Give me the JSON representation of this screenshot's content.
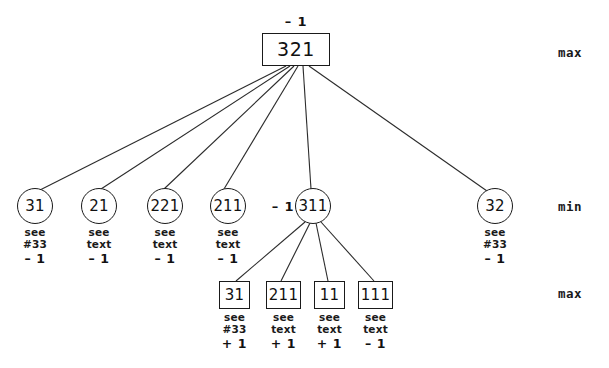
{
  "diagram": {
    "background_color": "#ffffff",
    "line_color": "#2b2b2b",
    "text_color": "#1a1a1a",
    "level_labels": [
      {
        "text": "max",
        "x": 558,
        "y": 52
      },
      {
        "text": "min",
        "x": 558,
        "y": 206
      },
      {
        "text": "max",
        "x": 558,
        "y": 293
      }
    ],
    "root": {
      "id": "root",
      "label": "321",
      "shape": "square",
      "x": 262,
      "y": 33,
      "width": 68,
      "height": 33,
      "value_tag": "– 1",
      "value_tag_x": 296,
      "value_tag_y": 21
    },
    "min_nodes": [
      {
        "id": "min-31",
        "label": "31",
        "shape": "circle",
        "cx": 35,
        "cy": 206,
        "r": 18,
        "annotation": {
          "line1": "see",
          "line2": "#33",
          "line3": "– 1"
        }
      },
      {
        "id": "min-21",
        "label": "21",
        "shape": "circle",
        "cx": 99,
        "cy": 206,
        "r": 18,
        "annotation": {
          "line1": "see",
          "line2": "text",
          "line3": "– 1"
        }
      },
      {
        "id": "min-221",
        "label": "221",
        "shape": "circle",
        "cx": 165,
        "cy": 206,
        "r": 18,
        "annotation": {
          "line1": "see",
          "line2": "text",
          "line3": "– 1"
        }
      },
      {
        "id": "min-211",
        "label": "211",
        "shape": "circle",
        "cx": 228,
        "cy": 206,
        "r": 18,
        "annotation": {
          "line1": "see",
          "line2": "text",
          "line3": "– 1"
        }
      },
      {
        "id": "min-311",
        "label": "311",
        "shape": "circle",
        "cx": 313,
        "cy": 206,
        "r": 18,
        "annotation": null,
        "value_tag": "– 1",
        "value_tag_x": 283,
        "value_tag_y": 206
      },
      {
        "id": "min-32",
        "label": "32",
        "shape": "circle",
        "cx": 495,
        "cy": 206,
        "r": 18,
        "annotation": {
          "line1": "see",
          "line2": "#33",
          "line3": "– 1"
        }
      }
    ],
    "leaf_nodes": [
      {
        "id": "leaf-31",
        "label": "31",
        "shape": "square",
        "x": 219,
        "y": 281,
        "width": 31,
        "height": 28,
        "annotation": {
          "line1": "see",
          "line2": "#33",
          "line3": "+ 1"
        }
      },
      {
        "id": "leaf-211",
        "label": "211",
        "shape": "square",
        "x": 266,
        "y": 281,
        "width": 35,
        "height": 28,
        "annotation": {
          "line1": "see",
          "line2": "text",
          "line3": "+ 1"
        }
      },
      {
        "id": "leaf-11",
        "label": "11",
        "shape": "square",
        "x": 314,
        "y": 281,
        "width": 31,
        "height": 28,
        "annotation": {
          "line1": "see",
          "line2": "text",
          "line3": "+ 1"
        }
      },
      {
        "id": "leaf-111",
        "label": "111",
        "shape": "square",
        "x": 358,
        "y": 281,
        "width": 35,
        "height": 28,
        "annotation": {
          "line1": "see",
          "line2": "text",
          "line3": "– 1"
        }
      }
    ],
    "edges": [
      {
        "from": "root",
        "to": "min-31",
        "x1": 286,
        "y1": 66,
        "x2": 40,
        "y2": 190
      },
      {
        "from": "root",
        "to": "min-21",
        "x1": 290,
        "y1": 66,
        "x2": 101,
        "y2": 189
      },
      {
        "from": "root",
        "to": "min-221",
        "x1": 294,
        "y1": 66,
        "x2": 164,
        "y2": 189
      },
      {
        "from": "root",
        "to": "min-211",
        "x1": 298,
        "y1": 66,
        "x2": 224,
        "y2": 189
      },
      {
        "from": "root",
        "to": "min-311",
        "x1": 303,
        "y1": 66,
        "x2": 311,
        "y2": 189
      },
      {
        "from": "root",
        "to": "min-32",
        "x1": 309,
        "y1": 66,
        "x2": 487,
        "y2": 191
      },
      {
        "from": "min-311",
        "to": "leaf-31",
        "x1": 305,
        "y1": 222,
        "x2": 236,
        "y2": 281
      },
      {
        "from": "min-311",
        "to": "leaf-211",
        "x1": 310,
        "y1": 223,
        "x2": 281,
        "y2": 281
      },
      {
        "from": "min-311",
        "to": "leaf-11",
        "x1": 316,
        "y1": 223,
        "x2": 328,
        "y2": 281
      },
      {
        "from": "min-311",
        "to": "leaf-111",
        "x1": 321,
        "y1": 222,
        "x2": 374,
        "y2": 281
      }
    ]
  }
}
